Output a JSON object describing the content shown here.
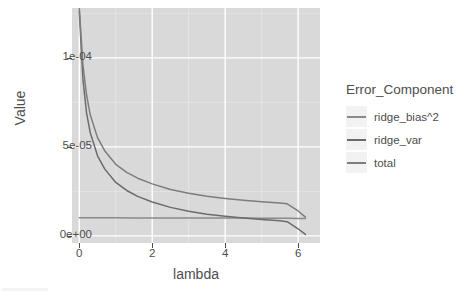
{
  "chart_data": {
    "type": "line",
    "title": "",
    "xlabel": "lambda",
    "ylabel": "Value",
    "xlim": [
      -0.2,
      6.6
    ],
    "ylim": [
      -4e-06,
      0.000128
    ],
    "xticks": [
      "0",
      "2",
      "4",
      "6"
    ],
    "xtick_values": [
      0,
      2,
      4,
      6
    ],
    "yticks": [
      "0e+00",
      "5e-05",
      "1e-04"
    ],
    "ytick_values": [
      0,
      5e-05,
      0.0001
    ],
    "grid": true,
    "grid_color": "#ffffff",
    "panel_color": "#d9d9d9",
    "legend_position": "right",
    "legend_title": "Error_Component",
    "series": [
      {
        "name": "ridge_bias^2",
        "color": "#8a8a8a",
        "x": [
          0,
          0.2,
          0.5,
          1,
          1.5,
          2,
          2.5,
          3,
          3.5,
          4,
          4.5,
          5,
          5.5,
          5.7,
          6.0,
          6.2
        ],
        "values": [
          1.02e-05,
          1.02e-05,
          1.02e-05,
          1.02e-05,
          1.01e-05,
          1.01e-05,
          1.01e-05,
          1e-05,
          1e-05,
          1e-05,
          1e-05,
          9.9e-06,
          9.9e-06,
          9.9e-06,
          9.8e-06,
          9.8e-06
        ]
      },
      {
        "name": "ridge_var",
        "color": "#6b6b6b",
        "x": [
          0,
          0.1,
          0.2,
          0.3,
          0.5,
          0.7,
          1,
          1.3,
          1.6,
          2,
          2.5,
          3,
          3.5,
          4,
          4.5,
          5,
          5.5,
          5.7,
          6.0,
          6.2
        ],
        "values": [
          0.000126,
          8.8e-05,
          6.9e-05,
          5.8e-05,
          4.5e-05,
          3.75e-05,
          3e-05,
          2.55e-05,
          2.22e-05,
          1.9e-05,
          1.6e-05,
          1.38e-05,
          1.22e-05,
          1.1e-05,
          1e-05,
          9.2e-06,
          8.5e-06,
          8e-06,
          4e-06,
          8e-07
        ]
      },
      {
        "name": "total",
        "color": "#7d7d7d",
        "x": [
          0,
          0.1,
          0.2,
          0.3,
          0.5,
          0.7,
          1,
          1.3,
          1.6,
          2,
          2.5,
          3,
          3.5,
          4,
          4.5,
          5,
          5.5,
          5.7,
          6.0,
          6.2
        ],
        "values": [
          0.000128,
          9.6e-05,
          7.9e-05,
          6.8e-05,
          5.52e-05,
          4.77e-05,
          4.02e-05,
          3.57e-05,
          3.24e-05,
          2.92e-05,
          2.61e-05,
          2.39e-05,
          2.22e-05,
          2.1e-05,
          2e-05,
          1.92e-05,
          1.85e-05,
          1.8e-05,
          1.4e-05,
          1.05e-05
        ]
      }
    ],
    "annotations": []
  },
  "axes": {
    "y_title": "Value",
    "x_title": "lambda"
  },
  "legend": {
    "title": "Error_Component",
    "entries": [
      {
        "label": "ridge_bias^2",
        "color": "#8a8a8a"
      },
      {
        "label": "ridge_var",
        "color": "#6b6b6b"
      },
      {
        "label": "total",
        "color": "#7d7d7d"
      }
    ]
  }
}
